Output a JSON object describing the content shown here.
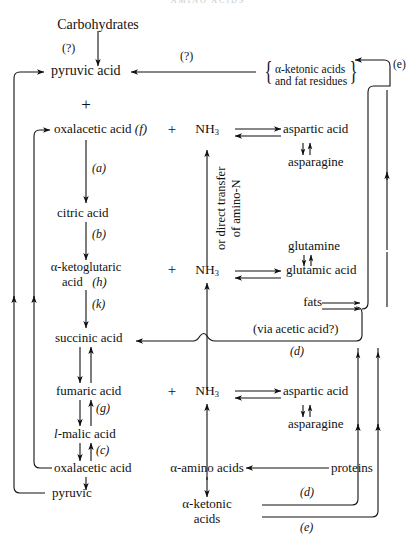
{
  "figure": {
    "header_faint": "AMINO ACIDS",
    "kind": "metabolic-pathway-diagram",
    "ink_color": "#111111"
  },
  "nodes": {
    "carbohydrates": "Carbohydrates",
    "pyruvic_acid": "pyruvic acid",
    "plus_top": "+",
    "oxalacetic_acid_f": "oxalacetic acid",
    "oxalacetic_f_tag": "(f)",
    "citric_acid": "citric acid",
    "ketoglutaric_l1": "α-ketoglutaric",
    "ketoglutaric_l2": "acid",
    "ketoglutaric_tag": "(h)",
    "succinic_acid": "succinic acid",
    "fumaric_acid": "fumaric acid",
    "l_malic_acid_prefix": "l",
    "l_malic_acid": "-malic acid",
    "oxalacetic_acid_bottom": "oxalacetic acid",
    "pyruvic_bottom": "pyruvic",
    "nh3": "NH",
    "nh3_sub": "3",
    "aspartic_acid_top": "aspartic acid",
    "asparagine_top": "asparagine",
    "glutamine": "glutamine",
    "glutamic_acid": "glutamic acid",
    "aspartic_acid_bottom": "aspartic acid",
    "asparagine_bottom": "asparagine",
    "fats": "fats",
    "proteins": "proteins",
    "amino_acids": "α-amino acids",
    "ketonic_acids_l1": "α-ketonic",
    "ketonic_acids_l2": "acids",
    "ketonic_fat_l1": "α-ketonic acids",
    "ketonic_fat_l2": "and fat residues",
    "plus_signs": [
      "+",
      "+",
      "+"
    ]
  },
  "annotations": {
    "q_carb": "(?)",
    "q_top_arrow": "(?)",
    "e_top_right": "(e)",
    "a": "(a)",
    "b": "(b)",
    "k": "(k)",
    "g": "(g)",
    "c": "(c)",
    "d_mid": "(d)",
    "d_bottom": "(d)",
    "e_bottom": "(e)",
    "via_acetic": "(via acetic acid?)",
    "vertical_note_l1": "or direct transfer",
    "vertical_note_l2": "of amino-N"
  }
}
